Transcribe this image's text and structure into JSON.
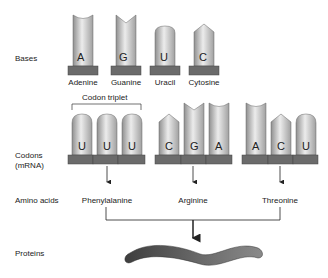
{
  "row_labels": {
    "bases": "Bases",
    "codons_line1": "Codons",
    "codons_line2": "(mRNA)",
    "amino_acids": "Amino acids",
    "proteins": "Proteins"
  },
  "bases": [
    {
      "letter": "A",
      "name": "Adenine",
      "shape": "concave-top"
    },
    {
      "letter": "G",
      "name": "Guanine",
      "shape": "notch-top"
    },
    {
      "letter": "U",
      "name": "Uracil",
      "shape": "round-top"
    },
    {
      "letter": "C",
      "name": "Cytosine",
      "shape": "point-top"
    }
  ],
  "codon_triplet_label": "Codon triplet",
  "codons": [
    {
      "letters": [
        "U",
        "U",
        "U"
      ],
      "amino_acid": "Phenylalanine"
    },
    {
      "letters": [
        "C",
        "G",
        "A"
      ],
      "amino_acid": "Arginine"
    },
    {
      "letters": [
        "A",
        "C",
        "U"
      ],
      "amino_acid": "Threonine"
    }
  ],
  "colors": {
    "base_plate": "#6b6b6b",
    "base_body_light": "#e6e6e6",
    "base_body_dark": "#9a9a9a",
    "protein": "#555555",
    "line": "#222222"
  }
}
